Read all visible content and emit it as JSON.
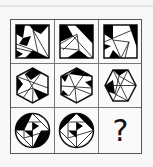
{
  "puzzle": {
    "rows": 3,
    "cols": 3,
    "cells": [
      {
        "row": 0,
        "col": 0,
        "shape": "square",
        "label": ""
      },
      {
        "row": 0,
        "col": 1,
        "shape": "square",
        "label": ""
      },
      {
        "row": 0,
        "col": 2,
        "shape": "square",
        "label": ""
      },
      {
        "row": 1,
        "col": 0,
        "shape": "hexagon",
        "label": ""
      },
      {
        "row": 1,
        "col": 1,
        "shape": "hexagon",
        "label": ""
      },
      {
        "row": 1,
        "col": 2,
        "shape": "hexagon",
        "label": ""
      },
      {
        "row": 2,
        "col": 0,
        "shape": "circle",
        "label": ""
      },
      {
        "row": 2,
        "col": 1,
        "shape": "circle",
        "label": ""
      },
      {
        "row": 2,
        "col": 2,
        "shape": "unknown",
        "label": "?"
      }
    ],
    "colors": {
      "fill": "#000000",
      "line": "#111111",
      "background": "#fafafa",
      "grid": "#666666"
    }
  }
}
